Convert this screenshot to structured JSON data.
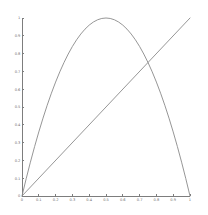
{
  "figure": {
    "background_color": "#ffffff",
    "line_color": "#8a8a8a",
    "axis_color": "#7d7d7d",
    "tick_label_color": "#6f6f6f"
  },
  "chart_data": {
    "type": "line",
    "title": "",
    "xlabel": "",
    "ylabel": "",
    "xlim": [
      0,
      1
    ],
    "ylim": [
      0,
      1
    ],
    "grid": false,
    "legend": null,
    "xticks": [
      0,
      0.1,
      0.2,
      0.3,
      0.4,
      0.5,
      0.6,
      0.7,
      0.8,
      0.9,
      1
    ],
    "xtick_labels": [
      "0",
      "0.1",
      "0.2",
      "0.3",
      "0.4",
      "0.5",
      "0.6",
      "0.7",
      "0.8",
      "0.9",
      "1"
    ],
    "yticks": [
      0,
      0.1,
      0.2,
      0.3,
      0.4,
      0.5,
      0.6,
      0.7,
      0.8,
      0.9,
      1
    ],
    "ytick_labels": [
      "0",
      "0.1",
      "0.2",
      "0.3",
      "0.4",
      "0.5",
      "0.6",
      "0.7",
      "0.8",
      "0.9",
      "1"
    ],
    "series": [
      {
        "name": "4x(1-x)",
        "type": "curve",
        "color": "#8a8a8a",
        "x": [
          0,
          0.025,
          0.05,
          0.075,
          0.1,
          0.125,
          0.15,
          0.175,
          0.2,
          0.225,
          0.25,
          0.275,
          0.3,
          0.325,
          0.35,
          0.375,
          0.4,
          0.425,
          0.45,
          0.475,
          0.5,
          0.525,
          0.55,
          0.575,
          0.6,
          0.625,
          0.65,
          0.675,
          0.7,
          0.725,
          0.75,
          0.775,
          0.8,
          0.825,
          0.85,
          0.875,
          0.9,
          0.925,
          0.95,
          0.975,
          1
        ],
        "values": [
          0,
          0.0975,
          0.19,
          0.2775,
          0.36,
          0.4375,
          0.51,
          0.5775,
          0.64,
          0.6975,
          0.75,
          0.7975,
          0.84,
          0.8775,
          0.91,
          0.9375,
          0.96,
          0.9775,
          0.99,
          0.9975,
          1,
          0.9975,
          0.99,
          0.9775,
          0.96,
          0.9375,
          0.91,
          0.8775,
          0.84,
          0.7975,
          0.75,
          0.6975,
          0.64,
          0.5775,
          0.51,
          0.4375,
          0.36,
          0.2775,
          0.19,
          0.0975,
          0
        ]
      },
      {
        "name": "x",
        "type": "line",
        "color": "#8a8a8a",
        "x": [
          0,
          1
        ],
        "values": [
          0,
          1
        ]
      }
    ],
    "annotations": []
  }
}
